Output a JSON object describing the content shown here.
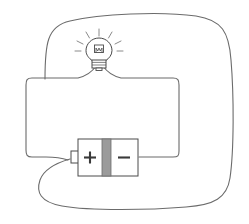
{
  "diagram": {
    "background_color": "#ffffff",
    "wire_color": "#6b6b6b",
    "outline_color": "#4a4a4a",
    "fill_color": "#ffffff",
    "divider_color": "#9b9b9b",
    "glow_color": "#8a8a8a",
    "wire_width": 1.1,
    "components": [
      {
        "id": "battery",
        "name": "battery-cell",
        "label_positive": "+",
        "label_negative": "−",
        "x": 78,
        "y": 139,
        "width": 60,
        "height": 37
      },
      {
        "id": "bulb",
        "name": "light-bulb",
        "state": "lit",
        "ray_count": 7,
        "cx": 99,
        "cy": 50
      },
      {
        "id": "outer-wire",
        "name": "outer-wire-loop"
      },
      {
        "id": "inner-wire",
        "name": "inner-wire-loop"
      }
    ]
  }
}
